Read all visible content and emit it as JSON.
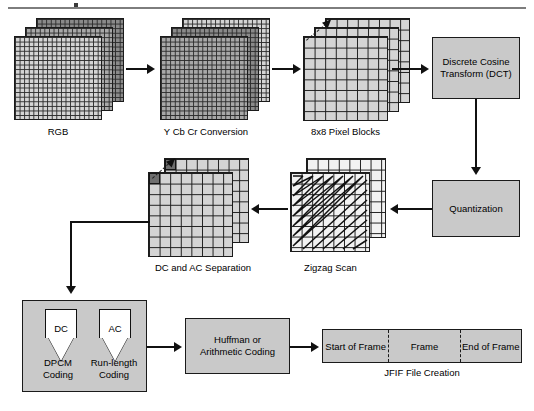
{
  "diagram": {
    "stages": {
      "rgb": {
        "label": "RGB"
      },
      "ycbcr": {
        "label": "Y Cb Cr Conversion"
      },
      "blocks": {
        "label": "8x8 Pixel Blocks"
      },
      "dct": {
        "label": "Discrete Cosine\nTransform (DCT)",
        "line1": "Discrete Cosine",
        "line2": "Transform (DCT)"
      },
      "quantization": {
        "label": "Quantization"
      },
      "zigzag": {
        "label": "Zigzag Scan"
      },
      "separation": {
        "label": "DC and AC Separation"
      },
      "entropy": {
        "dc_funnel": "DC",
        "ac_funnel": "AC",
        "dpcm_line1": "DPCM",
        "dpcm_line2": "Coding",
        "rle_line1": "Run-length",
        "rle_line2": "Coding"
      },
      "coding": {
        "line1": "Huffman or",
        "line2": "Arithmetic Coding"
      },
      "jfif": {
        "label": "JFIF File Creation",
        "segments": [
          {
            "label": "Start of Frame"
          },
          {
            "label": "Frame"
          },
          {
            "label": "End of Frame"
          }
        ]
      }
    },
    "colors": {
      "box_fill": "#c9c9c9",
      "box_border": "#1a1a1a",
      "plane_light": "#d4d4d4",
      "plane_mid": "#a8a8a8",
      "plane_dark": "#8a8a8a",
      "dc_cell": "#6e6e6e",
      "arrow": "#111111",
      "rule": "#7d7d7d"
    }
  }
}
